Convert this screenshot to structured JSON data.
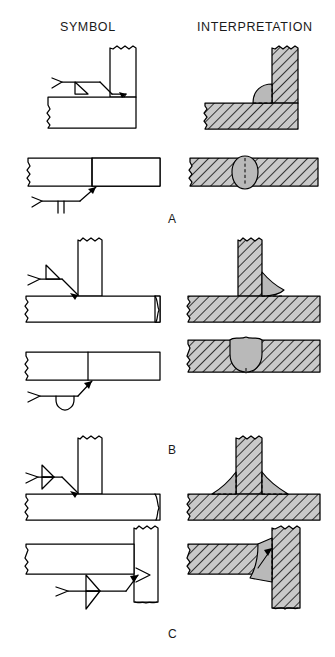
{
  "figure": {
    "headers": {
      "symbol": "SYMBOL",
      "interpretation": "INTERPRETATION"
    },
    "section_labels": {
      "a": "A",
      "b": "B",
      "c": "C"
    },
    "colors": {
      "line": "#000000",
      "weld_bead_fill": "#b9b9b9",
      "base_metal_hatch": "#000000",
      "background": "#ffffff",
      "text": "#1a1a1a"
    },
    "columns": [
      {
        "name": "symbol",
        "label": "SYMBOL"
      },
      {
        "name": "interpretation",
        "label": "INTERPRETATION"
      }
    ],
    "sections": [
      {
        "letter": "A",
        "rows": [
          {
            "weld_type": "fillet-weld",
            "joint": "corner-joint",
            "symbol_elements": [
              "arrow",
              "reference-line",
              "tail-flag",
              "fillet-triangle-below-line"
            ],
            "weld_side": "arrow-side",
            "interpretation": "single fillet weld at inside corner of L joint"
          },
          {
            "weld_type": "square-groove-weld",
            "joint": "butt-joint",
            "symbol_elements": [
              "arrow",
              "reference-line",
              "tail-flag",
              "square-groove-two-parallel-lines-below-line"
            ],
            "weld_side": "arrow-side",
            "interpretation": "square groove weld through butt joint of two plates"
          }
        ]
      },
      {
        "letter": "B",
        "rows": [
          {
            "weld_type": "fillet-weld",
            "joint": "tee-joint",
            "symbol_elements": [
              "arrow",
              "reference-line",
              "tail-flag",
              "fillet-triangle-above-line"
            ],
            "weld_side": "other-side",
            "interpretation": "single fillet weld on one side of tee joint"
          },
          {
            "weld_type": "u-groove-weld",
            "joint": "butt-joint",
            "symbol_elements": [
              "arrow",
              "reference-line",
              "tail-flag",
              "u-groove-symbol-below-line"
            ],
            "weld_side": "arrow-side",
            "interpretation": "U-groove weld through butt joint of two plates"
          }
        ]
      },
      {
        "letter": "C",
        "rows": [
          {
            "weld_type": "double-fillet-weld",
            "joint": "tee-joint",
            "symbol_elements": [
              "arrow",
              "reference-line",
              "tail-flag",
              "fillet-triangle-above-line",
              "fillet-triangle-below-line"
            ],
            "weld_side": "both-sides",
            "interpretation": "fillet welds on both sides of tee joint"
          },
          {
            "weld_type": "double-fillet-weld",
            "joint": "corner-joint",
            "symbol_elements": [
              "arrow",
              "reference-line",
              "tail-flag",
              "fillet-triangle-above-line",
              "fillet-triangle-below-line"
            ],
            "weld_side": "both-sides",
            "interpretation": "fillet welds on both sides of corner joint of plate to vertical member"
          }
        ]
      }
    ]
  }
}
